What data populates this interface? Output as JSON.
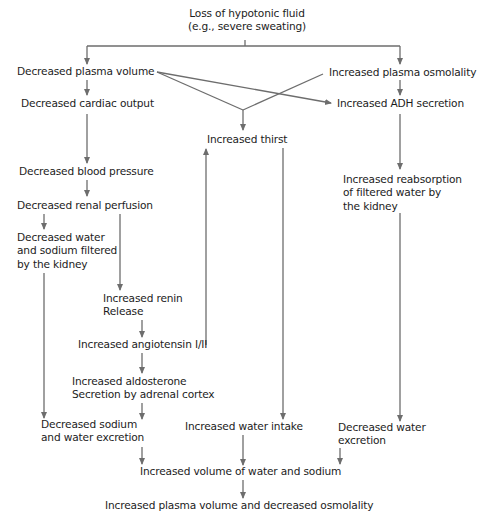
{
  "diagram": {
    "title": "Loss of hypotonic fluid",
    "title_sub": "(e.g., severe sweating)",
    "line_color": "#6d6d6d",
    "text_color": "#1c1c1c",
    "nodes": {
      "decreased_plasma_volume": "Decreased plasma volume",
      "increased_plasma_osmolality": "Increased plasma osmolality",
      "decreased_cardiac_output": "Decreased cardiac output",
      "increased_adh_secretion": "Increased ADH secretion",
      "increased_thirst": "Increased thirst",
      "decreased_blood_pressure": "Decreased blood pressure",
      "decreased_renal_perfusion": "Decreased renal perfusion",
      "increased_reabsorption": [
        "Increased reabsorption",
        "of filtered water by",
        "the kidney"
      ],
      "decreased_water_sodium_filtered": [
        "Decreased water",
        "and sodium filtered",
        "by the kidney"
      ],
      "increased_renin_release": [
        "Increased renin",
        "Release"
      ],
      "increased_angiotensin": "Increased angiotensin I/II",
      "increased_aldosterone": [
        "Increased aldosterone",
        "Secretion by adrenal cortex"
      ],
      "decreased_sodium_water_excretion": [
        "Decreased sodium",
        "and water excretion"
      ],
      "increased_water_intake": "Increased water intake",
      "decreased_water_excretion": [
        "Decreased water",
        "excretion"
      ],
      "increased_volume_water_sodium": "Increased volume of water and sodium",
      "final_outcome": "Increased plasma volume and decreased osmolality"
    },
    "edges": [
      {
        "from": "Loss of hypotonic fluid",
        "to": "Decreased plasma volume"
      },
      {
        "from": "Loss of hypotonic fluid",
        "to": "Increased plasma osmolality"
      },
      {
        "from": "Decreased plasma volume",
        "to": "Decreased cardiac output"
      },
      {
        "from": "Decreased plasma volume",
        "to": "Increased thirst"
      },
      {
        "from": "Decreased plasma volume",
        "to": "Increased ADH secretion"
      },
      {
        "from": "Increased plasma osmolality",
        "to": "Increased thirst"
      },
      {
        "from": "Increased plasma osmolality",
        "to": "Increased ADH secretion"
      },
      {
        "from": "Decreased cardiac output",
        "to": "Decreased blood pressure"
      },
      {
        "from": "Decreased blood pressure",
        "to": "Decreased renal perfusion"
      },
      {
        "from": "Decreased renal perfusion",
        "to": "Decreased water and sodium filtered by the kidney"
      },
      {
        "from": "Decreased renal perfusion",
        "to": "Increased renin Release"
      },
      {
        "from": "Increased renin Release",
        "to": "Increased angiotensin I/II"
      },
      {
        "from": "Increased angiotensin I/II",
        "to": "Increased thirst"
      },
      {
        "from": "Increased angiotensin I/II",
        "to": "Increased aldosterone Secretion by adrenal cortex"
      },
      {
        "from": "Increased ADH secretion",
        "to": "Increased reabsorption of filtered water by the kidney"
      },
      {
        "from": "Decreased water and sodium filtered by the kidney",
        "to": "Decreased sodium and water excretion"
      },
      {
        "from": "Increased aldosterone Secretion by adrenal cortex",
        "to": "Decreased sodium and water excretion"
      },
      {
        "from": "Increased thirst",
        "to": "Increased water intake"
      },
      {
        "from": "Increased reabsorption of filtered water by the kidney",
        "to": "Decreased water excretion"
      },
      {
        "from": "Decreased sodium and water excretion",
        "to": "Increased volume of water and sodium"
      },
      {
        "from": "Increased water intake",
        "to": "Increased volume of water and sodium"
      },
      {
        "from": "Decreased water excretion",
        "to": "Increased volume of water and sodium"
      },
      {
        "from": "Increased volume of water and sodium",
        "to": "Increased plasma volume and decreased osmolality"
      }
    ]
  }
}
